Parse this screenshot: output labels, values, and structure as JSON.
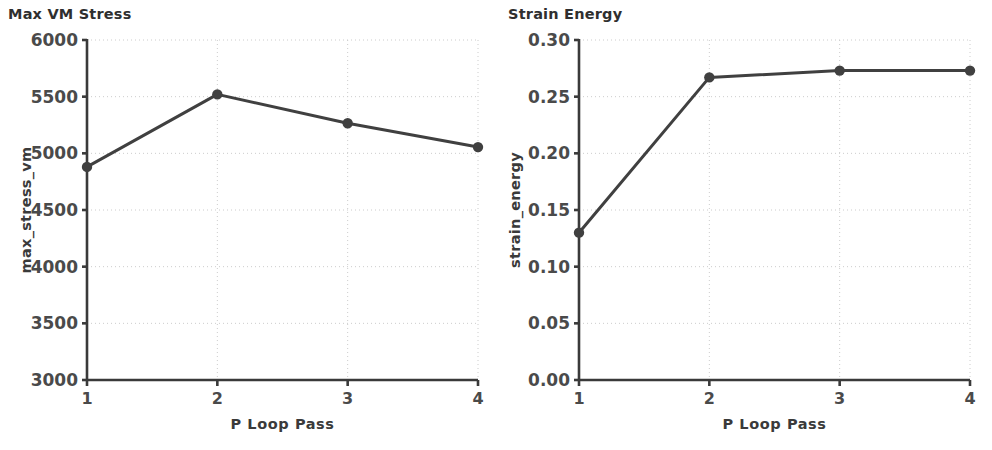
{
  "figure": {
    "background": "#ffffff",
    "width": 992,
    "height": 450
  },
  "chart_data": [
    {
      "type": "line",
      "title": "Max VM Stress",
      "xlabel": "P Loop Pass",
      "ylabel": "max_stress_vm",
      "x": [
        1,
        2,
        3,
        4
      ],
      "values": [
        4880,
        5520,
        5265,
        5055
      ],
      "xticks": [
        "1",
        "2",
        "3",
        "4"
      ],
      "yticks": [
        "3000",
        "3500",
        "4000",
        "4500",
        "5000",
        "5500",
        "6000"
      ],
      "ytick_values": [
        3000,
        3500,
        4000,
        4500,
        5000,
        5500,
        6000
      ],
      "xlim": [
        1,
        4
      ],
      "ylim": [
        3000,
        6000
      ],
      "grid": true,
      "legend": "none",
      "line_color": "#404040",
      "marker": "circle",
      "marker_color": "#404040"
    },
    {
      "type": "line",
      "title": "Strain Energy",
      "xlabel": "P Loop Pass",
      "ylabel": "strain_energy",
      "x": [
        1,
        2,
        3,
        4
      ],
      "values": [
        0.13,
        0.267,
        0.273,
        0.273
      ],
      "xticks": [
        "1",
        "2",
        "3",
        "4"
      ],
      "yticks": [
        "0.00",
        "0.05",
        "0.10",
        "0.15",
        "0.20",
        "0.25",
        "0.30"
      ],
      "ytick_values": [
        0.0,
        0.05,
        0.1,
        0.15,
        0.2,
        0.25,
        0.3
      ],
      "xlim": [
        1,
        4
      ],
      "ylim": [
        0.0,
        0.3
      ],
      "grid": true,
      "legend": "none",
      "line_color": "#404040",
      "marker": "circle",
      "marker_color": "#404040"
    }
  ],
  "colors": {
    "line": "#404040",
    "axis": "#3a3a3a",
    "grid": "#cccccc",
    "text": "#3a3a3a",
    "background": "#ffffff"
  }
}
